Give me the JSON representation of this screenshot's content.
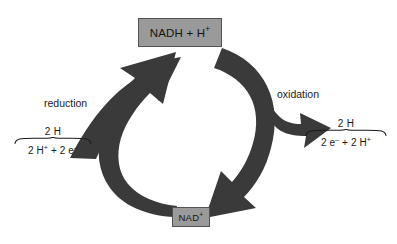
{
  "diagram": {
    "background_color": "#ffffff",
    "arrow_color": "#3a3a3a",
    "box_fill_color": "#9a9a9a",
    "box_border_color": "#54544f",
    "text_color": "#1b1b16"
  },
  "nodes": {
    "nadh": {
      "label_main": "NADH + H",
      "label_sup": "+"
    },
    "nad": {
      "label_main": "NAD",
      "label_sup": "+"
    }
  },
  "process_labels": {
    "reduction": "reduction",
    "oxidation": "oxidation"
  },
  "species": {
    "left": {
      "top": "2 H",
      "bottom_parts": [
        {
          "text": "2 H",
          "sup": "+"
        },
        {
          "text": " + 2 e",
          "sup": "–"
        }
      ],
      "bottom_plain": "2 H+ + 2 e–"
    },
    "right": {
      "top": "2 H",
      "bottom_parts": [
        {
          "text": "2 e",
          "sup": "–"
        },
        {
          "text": " + 2 H",
          "sup": "+"
        }
      ],
      "bottom_plain": "2 e– + 2 H+"
    }
  },
  "icons": {
    "reduction_cycle_arrow": "curved-arrow-up-left-icon",
    "reduction_input_arrow": "arrow-up-right-icon",
    "oxidation_cycle_arrow": "curved-arrow-down-left-icon",
    "oxidation_output_arrow": "arrow-right-icon"
  }
}
